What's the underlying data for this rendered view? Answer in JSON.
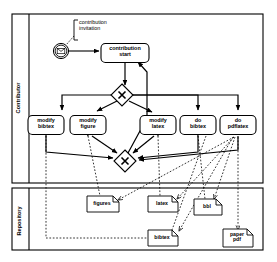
{
  "diagram": {
    "type": "bpmn-process-diagram",
    "title": "",
    "pools": [
      {
        "id": "contributor",
        "label": "Contributor",
        "x": 12,
        "y": 14,
        "width": 251,
        "height": 169,
        "header_width": 17
      },
      {
        "id": "repository",
        "label": "Repository",
        "x": 12,
        "y": 188,
        "width": 251,
        "height": 62,
        "header_width": 17
      }
    ],
    "events": [
      {
        "id": "start-event",
        "type": "message-start-event",
        "icon": "envelope-icon",
        "label": "",
        "cx": 61,
        "cy": 51,
        "r": 7.5
      }
    ],
    "annotations": [
      {
        "id": "contribution-invitation-annotation",
        "text": "contribution\ninvitation",
        "x": 78,
        "y": 21,
        "width": 44,
        "height": 16
      }
    ],
    "tasks": [
      {
        "id": "contribution-start",
        "label": "contribution\nstart",
        "cx": 125,
        "cy": 53,
        "width": 48,
        "height": 19
      },
      {
        "id": "modify-bibtex",
        "label": "modify\nbibtex",
        "cx": 46,
        "cy": 125,
        "width": 36,
        "height": 19
      },
      {
        "id": "modify-figure",
        "label": "modify\nfigure",
        "cx": 88,
        "cy": 125,
        "width": 36,
        "height": 19
      },
      {
        "id": "modify-latex",
        "label": "modify\nlatex",
        "cx": 158,
        "cy": 125,
        "width": 36,
        "height": 19
      },
      {
        "id": "do-bibtex",
        "label": "do\nbibtex",
        "cx": 198,
        "cy": 125,
        "width": 36,
        "height": 19
      },
      {
        "id": "do-pdflatex",
        "label": "do\npdflatex",
        "cx": 238,
        "cy": 125,
        "width": 36,
        "height": 19
      }
    ],
    "gateways": [
      {
        "id": "split-gateway",
        "type": "exclusive-gateway",
        "symbol": "X",
        "cx": 122,
        "cy": 95,
        "size": 16
      },
      {
        "id": "join-gateway",
        "type": "exclusive-gateway",
        "symbol": "X",
        "cx": 125,
        "cy": 161,
        "size": 16
      }
    ],
    "data_objects": [
      {
        "id": "figures-data",
        "label": "figures",
        "cx": 103,
        "cy": 204,
        "width": 32,
        "height": 16
      },
      {
        "id": "latex-data",
        "label": "latex",
        "cx": 163,
        "cy": 204,
        "width": 30,
        "height": 16
      },
      {
        "id": "bbl-data",
        "label": "bbl",
        "cx": 208,
        "cy": 207,
        "width": 28,
        "height": 16
      },
      {
        "id": "bibtex-data",
        "label": "bibtex",
        "cx": 163,
        "cy": 238,
        "width": 30,
        "height": 16
      },
      {
        "id": "paper-pdf-data",
        "label": "paper\npdf",
        "cx": 238,
        "cy": 238,
        "width": 30,
        "height": 18
      }
    ],
    "sequence_flows": [
      {
        "from": "start-event",
        "to": "contribution-start"
      },
      {
        "from": "contribution-start",
        "to": "split-gateway"
      },
      {
        "from": "split-gateway",
        "to": "modify-bibtex"
      },
      {
        "from": "split-gateway",
        "to": "modify-figure"
      },
      {
        "from": "split-gateway",
        "to": "modify-latex"
      },
      {
        "from": "split-gateway",
        "to": "do-bibtex"
      },
      {
        "from": "split-gateway",
        "to": "do-pdflatex"
      },
      {
        "from": "modify-bibtex",
        "to": "join-gateway"
      },
      {
        "from": "modify-figure",
        "to": "join-gateway"
      },
      {
        "from": "modify-latex",
        "to": "join-gateway"
      },
      {
        "from": "do-bibtex",
        "to": "join-gateway"
      },
      {
        "from": "do-pdflatex",
        "to": "join-gateway"
      },
      {
        "from": "join-gateway",
        "to": "contribution-start"
      }
    ],
    "data_associations": [
      {
        "from": "modify-bibtex",
        "to": "bibtex-data"
      },
      {
        "from": "modify-figure",
        "to": "figures-data"
      },
      {
        "from": "modify-latex",
        "to": "latex-data"
      },
      {
        "from": "do-bibtex",
        "to": "bbl-data"
      },
      {
        "from": "do-pdflatex",
        "to": "paper-pdf-data"
      },
      {
        "from": "do-pdflatex",
        "to": "figures-data"
      },
      {
        "from": "do-pdflatex",
        "to": "latex-data"
      },
      {
        "from": "do-pdflatex",
        "to": "bbl-data"
      },
      {
        "from": "do-bibtex",
        "to": "bibtex-data"
      }
    ],
    "colors": {
      "stroke": "#000000",
      "fill": "#ffffff",
      "background": "#ffffff"
    }
  }
}
